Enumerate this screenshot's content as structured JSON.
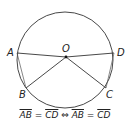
{
  "diagram": {
    "circle": {
      "cx": 65,
      "cy": 60,
      "r": 48
    },
    "center": {
      "label": "O",
      "x": 66,
      "y": 57
    },
    "points": [
      {
        "label": "A",
        "x": 17,
        "y": 53
      },
      {
        "label": "D",
        "x": 114,
        "y": 53
      },
      {
        "label": "B",
        "x": 26,
        "y": 88
      },
      {
        "label": "C",
        "x": 106,
        "y": 88
      }
    ],
    "segments": [
      [
        "A",
        "O"
      ],
      [
        "O",
        "D"
      ],
      [
        "O",
        "B"
      ],
      [
        "O",
        "C"
      ],
      [
        "A",
        "B"
      ],
      [
        "D",
        "C"
      ]
    ],
    "caption": "AB = CD ⇔ AB = CD",
    "caption_parts": {
      "left": "AB",
      "eq1": " = ",
      "mid": "CD",
      "iff": " ⇔ ",
      "right1": "AB",
      "eq2": " = ",
      "right2": "CD"
    }
  }
}
